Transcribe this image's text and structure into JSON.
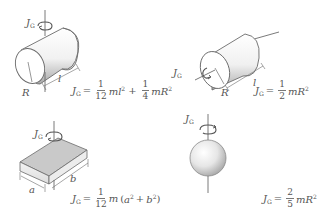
{
  "diagram": {
    "colors": {
      "outline": "#6b6b6b",
      "shade_dark": "#b5b5b5",
      "shade_light": "#f2f2f2",
      "top_face": "#c8c8c8",
      "text": "#555555"
    },
    "panels": [
      {
        "id": "cylinder-transverse",
        "shape": "solid cylinder, axis through center perpendicular to length",
        "axis_label": "J",
        "axis_label_sub": "G",
        "dimension_labels": [
          "R",
          "l"
        ],
        "formula": {
          "lhs": "J",
          "lhs_sub": "G",
          "eq": "=",
          "frac1_num": "1",
          "frac1_den": "12",
          "term1": "ml",
          "term1_exp": "2",
          "plus": "+",
          "frac2_num": "1",
          "frac2_den": "4",
          "term2": "mR",
          "term2_exp": "2"
        }
      },
      {
        "id": "cylinder-longitudinal",
        "shape": "solid cylinder, axis along length",
        "axis_label": "J",
        "axis_label_sub": "G",
        "dimension_labels": [
          "R",
          "l"
        ],
        "formula": {
          "lhs": "J",
          "lhs_sub": "G",
          "eq": "=",
          "frac1_num": "1",
          "frac1_den": "2",
          "term1": "mR",
          "term1_exp": "2"
        }
      },
      {
        "id": "rectangular-plate",
        "shape": "rectangular plate, axis perpendicular through center",
        "axis_label": "J",
        "axis_label_sub": "G",
        "dimension_labels": [
          "a",
          "b"
        ],
        "formula": {
          "lhs": "J",
          "lhs_sub": "G",
          "eq": "=",
          "frac1_num": "1",
          "frac1_den": "12",
          "term1": "m",
          "paren_open": "(",
          "a": "a",
          "a_exp": "2",
          "plus": "+",
          "b": "b",
          "b_exp": "2",
          "paren_close": ")"
        }
      },
      {
        "id": "solid-sphere",
        "shape": "solid sphere, axis through center",
        "axis_label": "J",
        "axis_label_sub": "G",
        "dimension_labels": [],
        "formula": {
          "lhs": "J",
          "lhs_sub": "G",
          "eq": "=",
          "frac1_num": "2",
          "frac1_den": "5",
          "term1": "mR",
          "term1_exp": "2"
        }
      }
    ]
  }
}
